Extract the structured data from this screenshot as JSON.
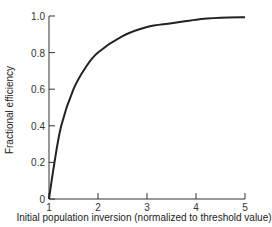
{
  "chart_data": {
    "type": "line",
    "title": "",
    "xlabel": "Initial population inversion (normalized to threshold value)",
    "ylabel": "Fractional efficiency",
    "xlim": [
      1,
      5
    ],
    "ylim": [
      0,
      1.0
    ],
    "x_ticks": [
      "1",
      "2",
      "3",
      "4",
      "5"
    ],
    "y_ticks": [
      "0",
      "0.2",
      "0.4",
      "0.6",
      "0.8",
      "1.0"
    ],
    "grid": false,
    "legend": null,
    "series": [
      {
        "name": "efficiency",
        "x": [
          1.0,
          1.1,
          1.25,
          1.5,
          1.75,
          2.0,
          2.5,
          3.0,
          3.5,
          4.0,
          4.5,
          5.0
        ],
        "y": [
          0.0,
          0.18,
          0.4,
          0.6,
          0.72,
          0.8,
          0.89,
          0.94,
          0.96,
          0.98,
          0.99,
          0.993
        ]
      }
    ]
  }
}
